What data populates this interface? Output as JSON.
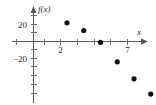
{
  "chart_data": {
    "type": "scatter",
    "title": "",
    "xlabel": "x",
    "ylabel": "f(x)",
    "x": [
      2,
      3,
      4,
      5,
      6,
      7
    ],
    "values": [
      22,
      13,
      -1,
      -24,
      -44,
      -62
    ],
    "points": [
      {
        "x": 2,
        "y": 22
      },
      {
        "x": 3,
        "y": 13
      },
      {
        "x": 4,
        "y": -1
      },
      {
        "x": 5,
        "y": -24
      },
      {
        "x": 6,
        "y": -44
      },
      {
        "x": 7,
        "y": -62
      }
    ],
    "xlim": [
      -1,
      8
    ],
    "ylim": [
      -75,
      35
    ],
    "x_tick_labels": [
      "2",
      "7"
    ],
    "y_tick_labels": [
      "20",
      "-20"
    ],
    "x_major_ticks": [
      2,
      7
    ],
    "x_minor_ticks": [
      -1,
      1,
      3,
      4,
      5,
      6
    ],
    "y_major_ticks": [
      20,
      -20
    ],
    "y_minor_ticks": [
      30,
      10,
      -10,
      -30,
      -40,
      -50,
      -60
    ],
    "grid": false,
    "legend": null,
    "marker": "filled-circle",
    "marker_color": "#111111",
    "axis_color": "#58585c"
  },
  "labels": {
    "y_axis_title": "f(x)",
    "x_axis_title": "x",
    "y_tick_20": "20",
    "y_tick_neg20": "−20",
    "x_tick_2": "2",
    "x_tick_7": "7"
  }
}
